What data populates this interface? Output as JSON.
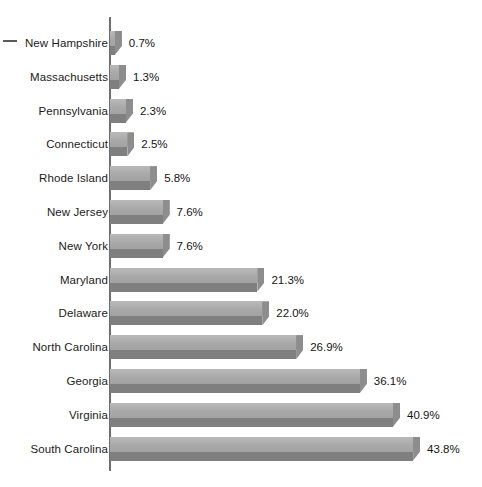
{
  "chart_data": {
    "type": "bar",
    "orientation": "horizontal",
    "title": "",
    "subtitle": "",
    "xlabel": "",
    "ylabel": "",
    "xlim": [
      0,
      45
    ],
    "grid": false,
    "legend": false,
    "value_suffix": "%",
    "categories": [
      "New Hampshire",
      "Massachusetts",
      "Pennsylvania",
      "Connecticut",
      "Rhode Island",
      "New Jersey",
      "New York",
      "Maryland",
      "Delaware",
      "North Carolina",
      "Georgia",
      "Virginia",
      "South Carolina"
    ],
    "values": [
      0.7,
      1.3,
      2.3,
      2.5,
      5.8,
      7.6,
      7.6,
      21.3,
      22.0,
      26.9,
      36.1,
      40.9,
      43.8
    ],
    "value_labels": [
      "0.7%",
      "1.3%",
      "2.3%",
      "2.5%",
      "5.8%",
      "7.6%",
      "7.6%",
      "21.3%",
      "22.0%",
      "26.9%",
      "36.1%",
      "40.9%",
      "43.8%"
    ],
    "colors": {
      "bar_top": "#aeaeae",
      "bar_bottom": "#7f7f7f",
      "bar_side": "#8d8d8d",
      "axis": "#6e6e6e",
      "label_text": "#1b1b1b",
      "background": "#ffffff"
    }
  }
}
